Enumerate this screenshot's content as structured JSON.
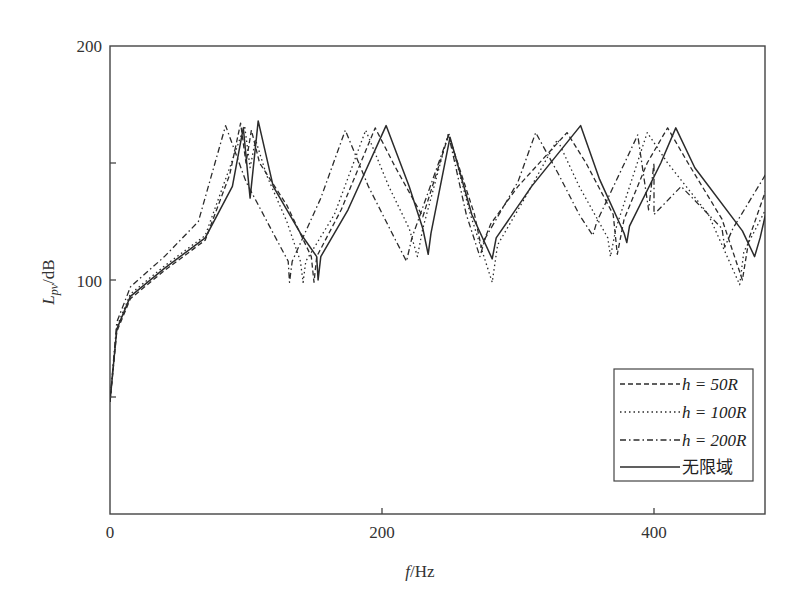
{
  "chart_data": {
    "type": "line",
    "title": "",
    "xlabel": "f/Hz",
    "ylabel": "L_pv/dB",
    "xlim": [
      0,
      482
    ],
    "ylim": [
      0,
      200
    ],
    "x_ticks": [
      0,
      200,
      400
    ],
    "y_ticks_labeled": [
      100,
      200
    ],
    "y_ticks_minor": [
      50,
      150
    ],
    "grid": false,
    "legend_position": "lower right (inside)",
    "series": [
      {
        "name": "h = 50R",
        "style": "dashed",
        "points": [
          [
            0,
            48
          ],
          [
            5,
            78
          ],
          [
            15,
            92
          ],
          [
            40,
            104
          ],
          [
            70,
            117
          ],
          [
            88,
            145
          ],
          [
            96,
            167
          ],
          [
            100,
            150
          ],
          [
            104,
            164
          ],
          [
            110,
            150
          ],
          [
            130,
            132
          ],
          [
            148,
            110
          ],
          [
            150,
            99
          ],
          [
            152,
            110
          ],
          [
            170,
            130
          ],
          [
            195,
            165
          ],
          [
            210,
            148
          ],
          [
            230,
            127
          ],
          [
            249,
            162
          ],
          [
            268,
            128
          ],
          [
            273,
            114
          ],
          [
            280,
            124
          ],
          [
            300,
            140
          ],
          [
            336,
            163
          ],
          [
            350,
            150
          ],
          [
            370,
            128
          ],
          [
            373,
            111
          ],
          [
            378,
            126
          ],
          [
            395,
            150
          ],
          [
            410,
            165
          ],
          [
            425,
            150
          ],
          [
            450,
            126
          ],
          [
            465,
            100
          ],
          [
            470,
            118
          ],
          [
            482,
            138
          ]
        ]
      },
      {
        "name": "h = 100R",
        "style": "dotted",
        "points": [
          [
            0,
            48
          ],
          [
            5,
            80
          ],
          [
            15,
            94
          ],
          [
            40,
            106
          ],
          [
            70,
            119
          ],
          [
            88,
            148
          ],
          [
            99,
            166
          ],
          [
            103,
            148
          ],
          [
            107,
            160
          ],
          [
            115,
            145
          ],
          [
            130,
            125
          ],
          [
            140,
            108
          ],
          [
            142,
            99
          ],
          [
            144,
            108
          ],
          [
            165,
            128
          ],
          [
            188,
            164
          ],
          [
            205,
            140
          ],
          [
            220,
            122
          ],
          [
            226,
            110
          ],
          [
            230,
            122
          ],
          [
            249,
            163
          ],
          [
            265,
            128
          ],
          [
            281,
            99
          ],
          [
            285,
            115
          ],
          [
            305,
            135
          ],
          [
            329,
            160
          ],
          [
            345,
            140
          ],
          [
            366,
            118
          ],
          [
            368,
            110
          ],
          [
            372,
            122
          ],
          [
            395,
            163
          ],
          [
            410,
            150
          ],
          [
            440,
            128
          ],
          [
            463,
            98
          ],
          [
            466,
            112
          ],
          [
            482,
            130
          ]
        ]
      },
      {
        "name": "h = 200R",
        "style": "dash-dot",
        "points": [
          [
            0,
            48
          ],
          [
            5,
            82
          ],
          [
            15,
            97
          ],
          [
            40,
            110
          ],
          [
            65,
            125
          ],
          [
            85,
            166
          ],
          [
            100,
            142
          ],
          [
            120,
            120
          ],
          [
            131,
            108
          ],
          [
            132,
            99
          ],
          [
            134,
            108
          ],
          [
            155,
            135
          ],
          [
            173,
            164
          ],
          [
            190,
            140
          ],
          [
            210,
            117
          ],
          [
            218,
            108
          ],
          [
            222,
            118
          ],
          [
            249,
            162
          ],
          [
            262,
            128
          ],
          [
            272,
            110
          ],
          [
            276,
            118
          ],
          [
            300,
            142
          ],
          [
            313,
            163
          ],
          [
            330,
            145
          ],
          [
            345,
            128
          ],
          [
            355,
            119
          ],
          [
            358,
            125
          ],
          [
            380,
            152
          ],
          [
            388,
            162
          ],
          [
            400,
            150
          ],
          [
            396,
            130
          ],
          [
            400,
            128
          ],
          [
            420,
            140
          ],
          [
            450,
            122
          ],
          [
            452,
            114
          ],
          [
            458,
            122
          ],
          [
            482,
            145
          ]
        ]
      },
      {
        "name": "无限域",
        "style": "solid",
        "points": [
          [
            0,
            48
          ],
          [
            5,
            79
          ],
          [
            15,
            93
          ],
          [
            40,
            105
          ],
          [
            70,
            118
          ],
          [
            90,
            140
          ],
          [
            98,
            165
          ],
          [
            103,
            135
          ],
          [
            109,
            168
          ],
          [
            120,
            140
          ],
          [
            140,
            120
          ],
          [
            152,
            110
          ],
          [
            153,
            100
          ],
          [
            155,
            110
          ],
          [
            175,
            130
          ],
          [
            203,
            166
          ],
          [
            220,
            140
          ],
          [
            230,
            122
          ],
          [
            234,
            111
          ],
          [
            236,
            120
          ],
          [
            250,
            161
          ],
          [
            266,
            128
          ],
          [
            281,
            109
          ],
          [
            284,
            118
          ],
          [
            310,
            140
          ],
          [
            346,
            166
          ],
          [
            360,
            143
          ],
          [
            378,
            120
          ],
          [
            380,
            116
          ],
          [
            382,
            123
          ],
          [
            405,
            150
          ],
          [
            416,
            165
          ],
          [
            430,
            148
          ],
          [
            465,
            121
          ],
          [
            474,
            110
          ],
          [
            478,
            118
          ],
          [
            482,
            128
          ]
        ]
      }
    ]
  },
  "legend": {
    "items": [
      {
        "label": "h = 50R",
        "style": "dashed"
      },
      {
        "label": "h = 100R",
        "style": "dotted"
      },
      {
        "label": "h = 200R",
        "style": "dash-dot"
      },
      {
        "label": "无限域",
        "style": "solid"
      }
    ]
  },
  "axes": {
    "x_tick_labels": [
      "0",
      "200",
      "400"
    ],
    "y_tick_labels": [
      "100",
      "200"
    ],
    "xlabel_italic": "f",
    "xlabel_rest": "/Hz",
    "ylabel_italic": "L",
    "ylabel_sub": "pv",
    "ylabel_rest": "/dB"
  },
  "colors": {
    "line": "#2b2b2b",
    "axis": "#444444"
  }
}
